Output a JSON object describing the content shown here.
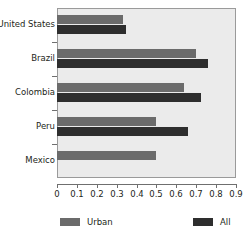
{
  "chart_data": {
    "type": "bar",
    "orientation": "horizontal",
    "title": "",
    "xlabel": "",
    "ylabel": "",
    "categories": [
      "United States",
      "Brazil",
      "Colombia",
      "Peru",
      "Mexico"
    ],
    "series": [
      {
        "name": "Urban",
        "color": "#6b6b6b",
        "values": [
          0.33,
          0.7,
          0.64,
          0.5,
          0.5
        ]
      },
      {
        "name": "All",
        "color": "#2e2e2e",
        "values": [
          0.345,
          0.76,
          0.725,
          0.66,
          null
        ]
      }
    ],
    "xlim": [
      0,
      0.9
    ],
    "xticks": [
      0,
      0.1,
      0.2,
      0.3,
      0.4,
      0.5,
      0.6,
      0.7,
      0.8,
      0.9
    ],
    "xtick_labels": [
      "0",
      "0.1",
      "0.2",
      "0.3",
      "0.4",
      "0.5",
      "0.6",
      "0.7",
      "0.8",
      "0.9"
    ],
    "grid": false,
    "legend_position": "bottom",
    "plot_background": "#ebebeb"
  },
  "legend": {
    "items": [
      {
        "label": "Urban",
        "color": "#6b6b6b"
      },
      {
        "label": "All",
        "color": "#2e2e2e"
      }
    ]
  }
}
